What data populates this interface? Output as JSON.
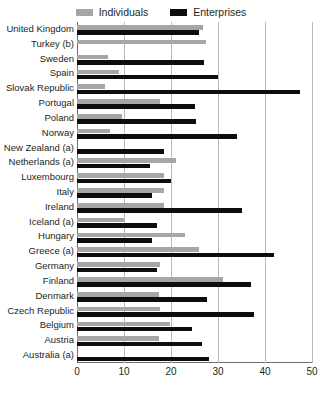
{
  "legend": {
    "entries": [
      {
        "label": "Individuals",
        "color": "#a6a6a6",
        "swatch_name": "individuals-swatch"
      },
      {
        "label": "Enterprises",
        "color": "#0d0d0d",
        "swatch_name": "enterprises-swatch"
      }
    ]
  },
  "axis": {
    "ticks": [
      "0",
      "10",
      "20",
      "30",
      "40",
      "50"
    ]
  },
  "chart_data": {
    "type": "bar",
    "orientation": "horizontal",
    "title": "",
    "xlabel": "",
    "ylabel": "",
    "xlim": [
      0,
      50
    ],
    "grid": true,
    "legend_position": "top-center",
    "categories": [
      "United Kingdom",
      "Turkey (b)",
      "Sweden",
      "Spain",
      "Slovak Republic",
      "Portugal",
      "Poland",
      "Norway",
      "New Zealand (a)",
      "Netherlands (a)",
      "Luxembourg",
      "Italy",
      "Ireland",
      "Iceland (a)",
      "Hungary",
      "Greece (a)",
      "Germany",
      "Finland",
      "Denmark",
      "Czech Republic",
      "Belgium",
      "Austria",
      "Australia (a)"
    ],
    "series": [
      {
        "name": "Individuals",
        "color": "#a6a6a6",
        "values": [
          26.8,
          27.5,
          6.6,
          9.0,
          6.0,
          17.7,
          9.5,
          7.0,
          null,
          21.0,
          18.5,
          18.5,
          18.5,
          10.0,
          23.0,
          26.0,
          17.7,
          31.0,
          17.5,
          17.7,
          19.8,
          17.5,
          null
        ]
      },
      {
        "name": "Enterprises",
        "color": "#0d0d0d",
        "values": [
          26.0,
          null,
          27.0,
          30.0,
          47.4,
          25.0,
          25.4,
          34.0,
          18.5,
          15.5,
          20.0,
          16.0,
          35.0,
          17.0,
          16.0,
          42.0,
          17.0,
          37.0,
          27.7,
          37.7,
          24.5,
          26.6,
          28.0
        ]
      }
    ]
  }
}
